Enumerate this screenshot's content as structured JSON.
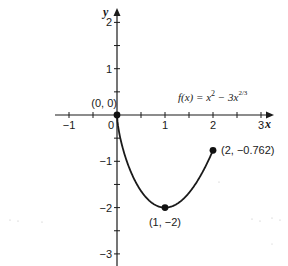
{
  "chart_data": {
    "type": "line",
    "title": "",
    "function_label": "f(x) = x² − 3x²ᐟ³",
    "function_label_parts": {
      "lhs": "f(x) = x",
      "sq": "2",
      "mid": " − 3x",
      "exp": "2/3"
    },
    "xlabel": "x",
    "ylabel": "y",
    "xlim": [
      -1.2,
      3.3
    ],
    "ylim": [
      -3.2,
      2.4
    ],
    "x_ticks_major": [
      -1,
      0,
      1,
      2,
      3
    ],
    "x_tick_labels": [
      "−1",
      "0",
      "1",
      "2",
      "3"
    ],
    "y_ticks_major": [
      -3,
      -2,
      -1,
      1,
      2
    ],
    "y_tick_labels": [
      "−3",
      "−2",
      "−1",
      "1",
      "2"
    ],
    "minor_ticks_step": 0.5,
    "grid": false,
    "domain": [
      0,
      2
    ],
    "series": [
      {
        "name": "f(x) = x^2 - 3x^(2/3)",
        "x": [
          0,
          0.05,
          0.1,
          0.2,
          0.3,
          0.4,
          0.5,
          0.6,
          0.7,
          0.8,
          0.9,
          1.0,
          1.1,
          1.2,
          1.3,
          1.4,
          1.5,
          1.6,
          1.7,
          1.8,
          1.9,
          2.0
        ],
        "y": [
          0,
          -0.41,
          -0.64,
          -1.0,
          -1.25,
          -1.47,
          -1.64,
          -1.78,
          -1.88,
          -1.95,
          -1.99,
          -2.0,
          -1.98,
          -1.95,
          -1.88,
          -1.8,
          -1.69,
          -1.55,
          -1.38,
          -1.2,
          -0.99,
          -0.762
        ]
      }
    ],
    "points": [
      {
        "x": 0,
        "y": 0,
        "label": "(0, 0)"
      },
      {
        "x": 1,
        "y": -2,
        "label": "(1, −2)"
      },
      {
        "x": 2,
        "y": -0.762,
        "label": "(2, −0.762)"
      }
    ]
  }
}
